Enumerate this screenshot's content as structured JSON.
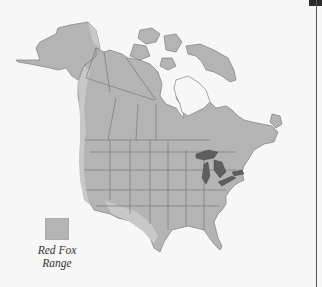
{
  "map": {
    "subject": "Red Fox range in North America",
    "region": "North America (Alaska, Canada, USA)",
    "colors": {
      "background": "#f7f7f7",
      "land": "#b4b4b4",
      "range_light": "#c8c8c8",
      "borders": "#6e6e6e",
      "great_lakes": "#5e5e5e",
      "water_bays": "#f7f7f7"
    },
    "features": [
      "Great Lakes highlighted dark gray",
      "Hudson Bay",
      "Canadian Arctic Archipelago",
      "State and provincial borders"
    ]
  },
  "legend": {
    "swatch_color": "#b4b4b4",
    "label_line1": "Red Fox",
    "label_line2": "Range"
  }
}
